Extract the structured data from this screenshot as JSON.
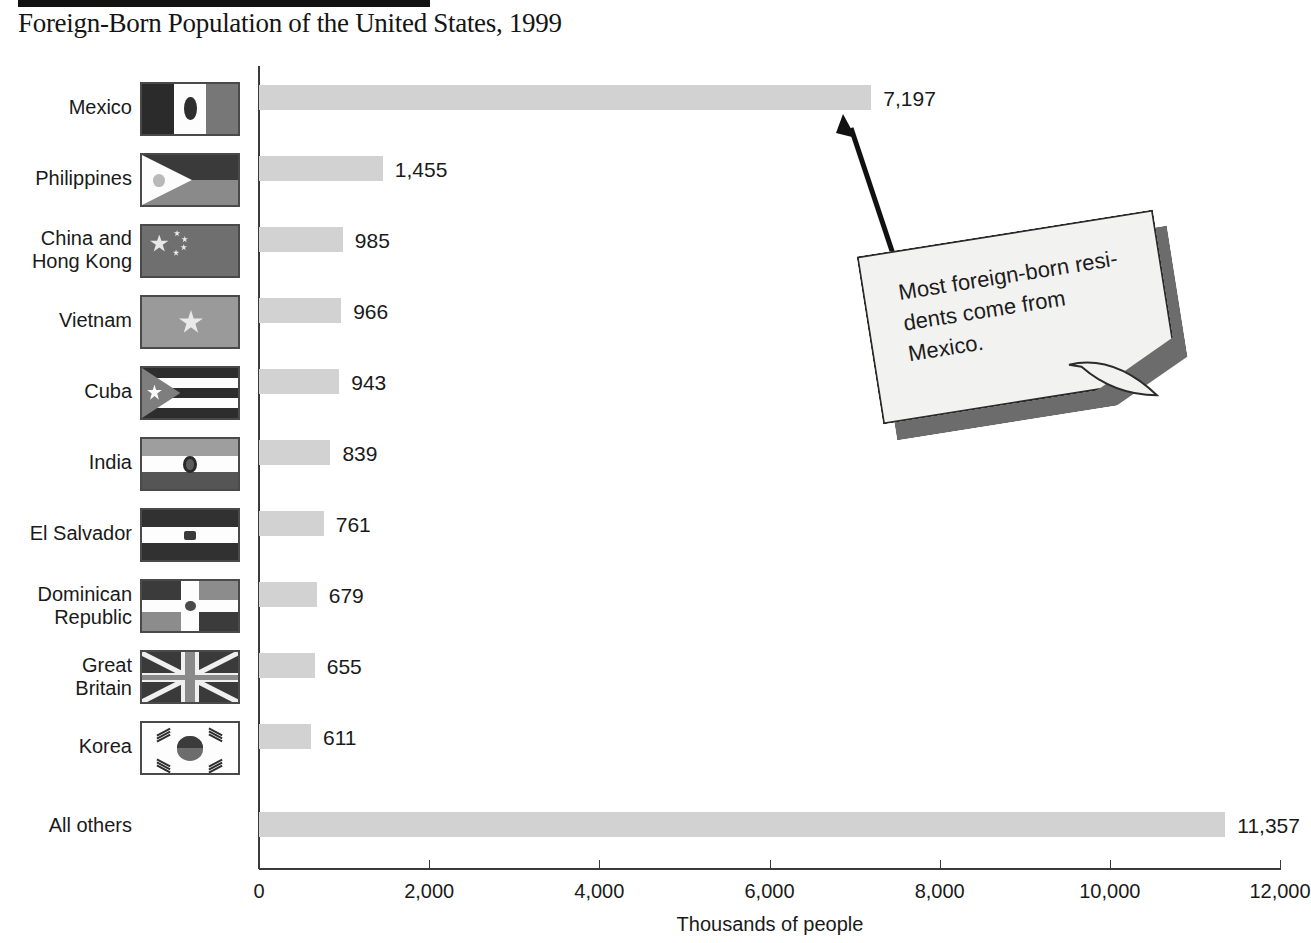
{
  "header": {
    "title": "Foreign-Born Population of the United States, 1999"
  },
  "annotation": {
    "text": "Most foreign-born resi-\ndents come from\nMexico.",
    "arrow_name": "callout-arrow"
  },
  "chart_data": {
    "type": "bar",
    "orientation": "horizontal",
    "title": "Foreign-Born Population of the United States, 1999",
    "xlabel": "Thousands of people",
    "ylabel": "",
    "xlim": [
      0,
      12000
    ],
    "xticks": [
      "0",
      "2,000",
      "4,000",
      "6,000",
      "8,000",
      "10,000",
      "12,000"
    ],
    "xtick_values": [
      0,
      2000,
      4000,
      6000,
      8000,
      10000,
      12000
    ],
    "grid": false,
    "legend": "none",
    "bar_color": "#d2d2d2",
    "categories": [
      "Mexico",
      "Philippines",
      "China and\nHong Kong",
      "Vietnam",
      "Cuba",
      "India",
      "El Salvador",
      "Dominican\nRepublic",
      "Great\nBritain",
      "Korea",
      "All others"
    ],
    "values": [
      7197,
      1455,
      985,
      966,
      943,
      839,
      761,
      679,
      655,
      611,
      11357
    ],
    "value_labels": [
      "7,197",
      "1,455",
      "985",
      "966",
      "943",
      "839",
      "761",
      "679",
      "655",
      "611",
      "11,357"
    ],
    "flags": [
      "flag-mexico",
      "flag-philippines",
      "flag-china",
      "flag-vietnam",
      "flag-cuba",
      "flag-india",
      "flag-el-salvador",
      "flag-dominican-republic",
      "flag-great-britain",
      "flag-korea",
      null
    ],
    "annotation": "Most foreign-born residents come from Mexico."
  }
}
